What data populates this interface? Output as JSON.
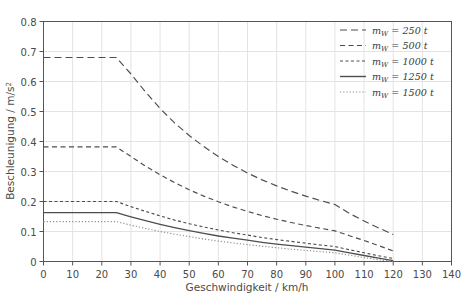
{
  "chart_data": {
    "type": "line",
    "title": "",
    "xlabel": "Geschwindigkeit / km/h",
    "ylabel": "Beschleunigung / m/s²",
    "xlim": [
      0,
      140
    ],
    "ylim": [
      0,
      0.8
    ],
    "xticks": [
      "0",
      "10",
      "20",
      "30",
      "40",
      "50",
      "60",
      "70",
      "80",
      "90",
      "100",
      "110",
      "120",
      "130",
      "140"
    ],
    "yticks": [
      "0",
      "0.1",
      "0.2",
      "0.3",
      "0.4",
      "0.5",
      "0.6",
      "0.7",
      "0.8"
    ],
    "grid": true,
    "legend_position": "top-right",
    "x": [
      0,
      5,
      10,
      15,
      20,
      25,
      30,
      35,
      40,
      45,
      50,
      55,
      60,
      65,
      70,
      75,
      80,
      85,
      90,
      95,
      100,
      105,
      110,
      115,
      120
    ],
    "series": [
      {
        "name": "m_W = 250 t",
        "label": "250",
        "unit": "t",
        "style": "dashed-long",
        "color": "#4d4d4d",
        "plateau_value": 0.68,
        "plateau_until": 25,
        "values": [
          0.68,
          0.68,
          0.68,
          0.68,
          0.68,
          0.68,
          0.625,
          0.565,
          0.51,
          0.462,
          0.42,
          0.383,
          0.35,
          0.321,
          0.295,
          0.272,
          0.252,
          0.234,
          0.218,
          0.203,
          0.19,
          0.16,
          0.135,
          0.112,
          0.09
        ]
      },
      {
        "name": "m_W = 500 t",
        "label": "500",
        "unit": "t",
        "style": "dashed-medium",
        "color": "#4d4d4d",
        "plateau_value": 0.382,
        "plateau_until": 25,
        "values": [
          0.382,
          0.382,
          0.382,
          0.382,
          0.382,
          0.382,
          0.35,
          0.318,
          0.289,
          0.263,
          0.239,
          0.218,
          0.199,
          0.182,
          0.167,
          0.153,
          0.141,
          0.13,
          0.12,
          0.111,
          0.102,
          0.086,
          0.07,
          0.053,
          0.035
        ]
      },
      {
        "name": "m_W = 1000 t",
        "label": "1000",
        "unit": "t",
        "style": "dashed-short",
        "color": "#4d4d4d",
        "plateau_value": 0.2,
        "plateau_until": 25,
        "values": [
          0.2,
          0.2,
          0.2,
          0.2,
          0.2,
          0.2,
          0.183,
          0.167,
          0.152,
          0.138,
          0.126,
          0.115,
          0.105,
          0.096,
          0.088,
          0.08,
          0.073,
          0.067,
          0.061,
          0.055,
          0.05,
          0.039,
          0.029,
          0.019,
          0.01
        ]
      },
      {
        "name": "m_W = 1250 t",
        "label": "1250",
        "unit": "t",
        "style": "solid",
        "color": "#4d4d4d",
        "plateau_value": 0.163,
        "plateau_until": 25,
        "values": [
          0.163,
          0.163,
          0.163,
          0.163,
          0.163,
          0.163,
          0.149,
          0.136,
          0.124,
          0.113,
          0.103,
          0.094,
          0.085,
          0.078,
          0.071,
          0.064,
          0.058,
          0.053,
          0.048,
          0.043,
          0.038,
          0.029,
          0.02,
          0.011,
          0.003
        ]
      },
      {
        "name": "m_W = 1500 t",
        "label": "1500",
        "unit": "t",
        "style": "dotted",
        "color": "#8c8c8c",
        "plateau_value": 0.133,
        "plateau_until": 25,
        "values": [
          0.133,
          0.133,
          0.133,
          0.133,
          0.133,
          0.133,
          0.121,
          0.11,
          0.1,
          0.091,
          0.083,
          0.075,
          0.068,
          0.062,
          0.056,
          0.051,
          0.046,
          0.041,
          0.037,
          0.033,
          0.029,
          0.021,
          0.013,
          0.006,
          0.0
        ]
      }
    ],
    "legend": [
      {
        "label_prefix": "m",
        "label_sub": "W",
        "label_eq": " = 250",
        "label_unit": "t"
      },
      {
        "label_prefix": "m",
        "label_sub": "W",
        "label_eq": " = 500",
        "label_unit": "t"
      },
      {
        "label_prefix": "m",
        "label_sub": "W",
        "label_eq": " = 1000",
        "label_unit": "t"
      },
      {
        "label_prefix": "m",
        "label_sub": "W",
        "label_eq": " = 1250",
        "label_unit": "t"
      },
      {
        "label_prefix": "m",
        "label_sub": "W",
        "label_eq": " = 1500",
        "label_unit": "t"
      }
    ],
    "colors": {
      "axis": "#555555",
      "grid": "#e3e3e3",
      "text": "#4a4a4a",
      "background": "#ffffff"
    }
  }
}
